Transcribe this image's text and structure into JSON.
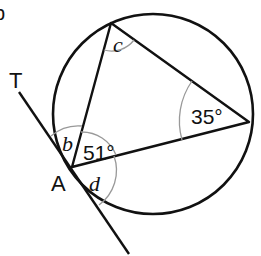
{
  "diagram": {
    "type": "circle-theorem",
    "corner_label": "b",
    "points": {
      "A": {
        "label": "A"
      },
      "T": {
        "label": "T"
      }
    },
    "angles": {
      "c": {
        "label": "c"
      },
      "b": {
        "label": "b"
      },
      "d": {
        "label": "d"
      },
      "angle_at_A": {
        "label": "51°"
      },
      "angle_right": {
        "label": "35°"
      }
    },
    "colors": {
      "line": "#111111",
      "arc": "#999999",
      "background": "#ffffff"
    }
  }
}
